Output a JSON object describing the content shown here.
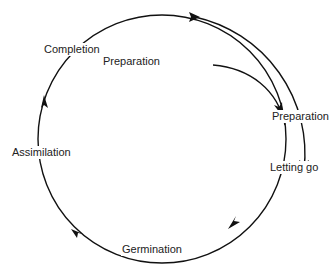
{
  "diagram": {
    "type": "cycle",
    "stages": [
      {
        "id": "completion",
        "label": "Completion"
      },
      {
        "id": "preparation_inner",
        "label": "Preparation"
      },
      {
        "id": "letting_go",
        "label": "Letting go"
      },
      {
        "id": "germination",
        "label": "Germination"
      },
      {
        "id": "assimilation",
        "label": "Assimilation"
      }
    ],
    "outer_branch": {
      "label": "Preparation"
    },
    "colors": {
      "stroke": "#111111",
      "text": "#222222",
      "background": "#ffffff"
    }
  }
}
